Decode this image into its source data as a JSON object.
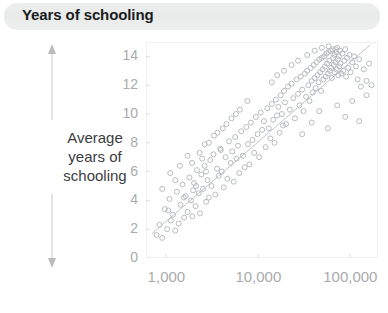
{
  "banner": {
    "title": "Years of schooling"
  },
  "axis": {
    "y_label_lines": [
      "Average",
      "years of",
      "schooling"
    ],
    "y_arrow_name": "vertical-double-arrow"
  },
  "chart_data": {
    "type": "scatter",
    "title": "Years of schooling",
    "xlabel": "",
    "ylabel": "Average years of schooling",
    "x_scale": "log",
    "y_scale": "linear",
    "xlim": [
      600,
      200000
    ],
    "ylim": [
      0,
      15
    ],
    "grid": false,
    "legend": null,
    "xticks": [
      1000,
      10000,
      100000
    ],
    "xtick_labels": [
      "1,000",
      "10,000",
      "100,000"
    ],
    "yticks": [
      0,
      2,
      4,
      6,
      8,
      10,
      12,
      14
    ],
    "ytick_labels": [
      "0",
      "2",
      "4",
      "6",
      "8",
      "10",
      "12",
      "14"
    ],
    "marker": {
      "shape": "open-circle",
      "size": 5,
      "color": "#b9bcbe",
      "fill": "none"
    },
    "trendline": {
      "type": "linear-on-log-x",
      "x0": 700,
      "y0": 1.7,
      "x1": 165000,
      "y1": 14.8,
      "color": "#c2c5c7"
    },
    "points": [
      [
        780,
        1.6
      ],
      [
        840,
        2.3
      ],
      [
        900,
        1.4
      ],
      [
        960,
        3.4
      ],
      [
        1020,
        2.0
      ],
      [
        1080,
        4.1
      ],
      [
        1120,
        2.6
      ],
      [
        1180,
        3.0
      ],
      [
        1250,
        1.9
      ],
      [
        1300,
        4.6
      ],
      [
        1360,
        2.4
      ],
      [
        1420,
        3.7
      ],
      [
        1500,
        5.1
      ],
      [
        1560,
        2.8
      ],
      [
        1620,
        4.3
      ],
      [
        1700,
        3.2
      ],
      [
        1780,
        5.6
      ],
      [
        1850,
        4.0
      ],
      [
        1920,
        2.9
      ],
      [
        2000,
        5.2
      ],
      [
        2080,
        3.6
      ],
      [
        2150,
        6.1
      ],
      [
        2240,
        4.5
      ],
      [
        2320,
        3.1
      ],
      [
        2400,
        5.8
      ],
      [
        2500,
        4.8
      ],
      [
        2600,
        6.4
      ],
      [
        2700,
        3.9
      ],
      [
        2800,
        5.4
      ],
      [
        2900,
        4.2
      ],
      [
        3000,
        6.8
      ],
      [
        3100,
        5.0
      ],
      [
        3250,
        7.2
      ],
      [
        3400,
        4.4
      ],
      [
        3550,
        6.2
      ],
      [
        3700,
        5.7
      ],
      [
        3850,
        7.6
      ],
      [
        4000,
        6.0
      ],
      [
        4200,
        4.9
      ],
      [
        4400,
        7.0
      ],
      [
        4600,
        5.5
      ],
      [
        4800,
        8.1
      ],
      [
        5000,
        6.6
      ],
      [
        5200,
        7.4
      ],
      [
        5400,
        5.3
      ],
      [
        5600,
        8.4
      ],
      [
        5800,
        6.9
      ],
      [
        6000,
        7.8
      ],
      [
        6200,
        5.9
      ],
      [
        6500,
        8.8
      ],
      [
        6800,
        7.1
      ],
      [
        7100,
        6.3
      ],
      [
        7400,
        9.1
      ],
      [
        7700,
        7.9
      ],
      [
        8000,
        6.5
      ],
      [
        8300,
        9.4
      ],
      [
        8600,
        8.2
      ],
      [
        9000,
        7.3
      ],
      [
        9400,
        9.8
      ],
      [
        9800,
        8.6
      ],
      [
        10200,
        7.0
      ],
      [
        10600,
        10.1
      ],
      [
        11000,
        8.9
      ],
      [
        11500,
        9.5
      ],
      [
        12000,
        7.7
      ],
      [
        12500,
        10.4
      ],
      [
        13000,
        9.0
      ],
      [
        13500,
        8.3
      ],
      [
        14000,
        10.7
      ],
      [
        14500,
        9.6
      ],
      [
        15000,
        8.0
      ],
      [
        15500,
        11.0
      ],
      [
        16000,
        9.9
      ],
      [
        16500,
        10.5
      ],
      [
        17000,
        8.7
      ],
      [
        17500,
        11.3
      ],
      [
        18000,
        10.0
      ],
      [
        18500,
        9.2
      ],
      [
        19000,
        11.6
      ],
      [
        19500,
        10.8
      ],
      [
        20000,
        9.3
      ],
      [
        21000,
        11.9
      ],
      [
        22000,
        10.3
      ],
      [
        23000,
        12.1
      ],
      [
        24000,
        11.1
      ],
      [
        25000,
        9.7
      ],
      [
        26000,
        12.4
      ],
      [
        27000,
        11.4
      ],
      [
        28000,
        10.6
      ],
      [
        29000,
        12.6
      ],
      [
        30000,
        11.7
      ],
      [
        31000,
        10.2
      ],
      [
        32000,
        12.8
      ],
      [
        33000,
        11.2
      ],
      [
        34000,
        13.0
      ],
      [
        35000,
        12.0
      ],
      [
        36000,
        10.9
      ],
      [
        37000,
        13.2
      ],
      [
        38000,
        12.3
      ],
      [
        39000,
        11.5
      ],
      [
        40000,
        13.4
      ],
      [
        41000,
        12.5
      ],
      [
        42000,
        11.8
      ],
      [
        43000,
        13.6
      ],
      [
        44000,
        12.7
      ],
      [
        45000,
        12.2
      ],
      [
        46000,
        13.8
      ],
      [
        47000,
        12.9
      ],
      [
        48000,
        11.6
      ],
      [
        49000,
        13.9
      ],
      [
        50000,
        13.1
      ],
      [
        51000,
        12.4
      ],
      [
        52000,
        14.0
      ],
      [
        53000,
        13.3
      ],
      [
        54000,
        12.6
      ],
      [
        55000,
        14.2
      ],
      [
        56000,
        13.5
      ],
      [
        57000,
        12.8
      ],
      [
        58000,
        14.3
      ],
      [
        59000,
        13.7
      ],
      [
        60000,
        13.0
      ],
      [
        61000,
        14.4
      ],
      [
        62000,
        13.2
      ],
      [
        63000,
        12.5
      ],
      [
        64000,
        14.5
      ],
      [
        65000,
        13.9
      ],
      [
        66000,
        13.4
      ],
      [
        67000,
        14.1
      ],
      [
        68000,
        12.9
      ],
      [
        69000,
        13.6
      ],
      [
        70000,
        14.3
      ],
      [
        71000,
        13.1
      ],
      [
        72000,
        14.6
      ],
      [
        73000,
        13.8
      ],
      [
        74000,
        12.7
      ],
      [
        75000,
        14.0
      ],
      [
        76000,
        13.3
      ],
      [
        77000,
        14.4
      ],
      [
        78000,
        13.5
      ],
      [
        80000,
        12.8
      ],
      [
        82000,
        14.2
      ],
      [
        84000,
        13.0
      ],
      [
        86000,
        13.7
      ],
      [
        88000,
        14.5
      ],
      [
        90000,
        12.6
      ],
      [
        92000,
        13.9
      ],
      [
        95000,
        13.2
      ],
      [
        98000,
        14.1
      ],
      [
        101000,
        12.9
      ],
      [
        105000,
        13.6
      ],
      [
        110000,
        14.0
      ],
      [
        115000,
        13.3
      ],
      [
        120000,
        12.4
      ],
      [
        125000,
        13.8
      ],
      [
        130000,
        11.9
      ],
      [
        140000,
        13.1
      ],
      [
        150000,
        12.3
      ],
      [
        160000,
        13.5
      ],
      [
        2600,
        7.9
      ],
      [
        3300,
        8.5
      ],
      [
        4100,
        9.0
      ],
      [
        5100,
        9.7
      ],
      [
        6300,
        10.3
      ],
      [
        7600,
        10.9
      ],
      [
        1900,
        6.6
      ],
      [
        2300,
        7.3
      ],
      [
        2900,
        8.0
      ],
      [
        3600,
        8.7
      ],
      [
        4500,
        9.3
      ],
      [
        5700,
        10.0
      ],
      [
        14000,
        12.2
      ],
      [
        16000,
        12.7
      ],
      [
        19000,
        13.0
      ],
      [
        23000,
        13.4
      ],
      [
        27000,
        13.7
      ],
      [
        34000,
        14.1
      ],
      [
        41000,
        14.4
      ],
      [
        49000,
        14.6
      ],
      [
        58000,
        14.7
      ],
      [
        69000,
        14.5
      ],
      [
        30000,
        8.6
      ],
      [
        38000,
        9.4
      ],
      [
        46000,
        10.2
      ],
      [
        57000,
        9.0
      ],
      [
        72000,
        10.6
      ],
      [
        88000,
        9.8
      ],
      [
        105000,
        10.9
      ],
      [
        125000,
        9.5
      ],
      [
        150000,
        11.3
      ],
      [
        170000,
        12.0
      ],
      [
        1100,
        5.9
      ],
      [
        1400,
        6.4
      ],
      [
        1700,
        7.1
      ],
      [
        2100,
        5.0
      ],
      [
        2700,
        6.0
      ],
      [
        3900,
        7.5
      ],
      [
        900,
        4.8
      ],
      [
        1050,
        3.3
      ],
      [
        1250,
        5.4
      ],
      [
        1550,
        4.2
      ],
      [
        1950,
        4.7
      ],
      [
        2450,
        6.9
      ]
    ]
  },
  "colors": {
    "banner_bg": "#eceded",
    "title_text": "#1b1c1e",
    "tick_text": "#a9abac",
    "marker": "#b9bcbe",
    "trendline": "#c2c5c7",
    "frame": "#f0f1f1"
  }
}
